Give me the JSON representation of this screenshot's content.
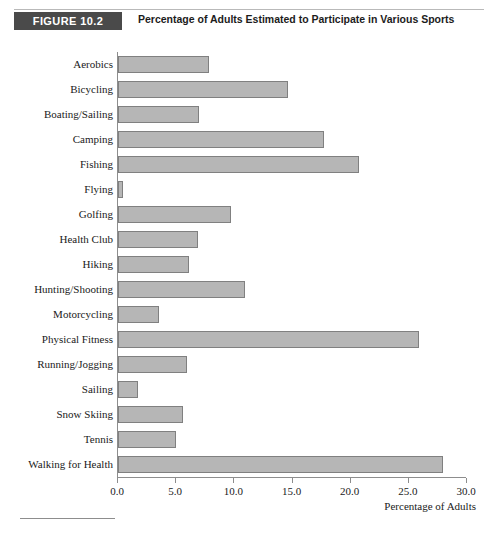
{
  "figure": {
    "badge": "FIGURE 10.2",
    "title": "Percentage of Adults Estimated to Participate in Various Sports"
  },
  "colors": {
    "badge_background": "#4a4a4a",
    "badge_text": "#ffffff",
    "bar_fill": "#b6b6b6",
    "bar_border": "#808080",
    "axis": "#8d8d8d",
    "text": "#1a1a1a"
  },
  "chart_data": {
    "type": "bar",
    "orientation": "horizontal",
    "title": "Percentage of Adults Estimated to Participate in Various Sports",
    "xlabel": "Percentage of Adults",
    "ylabel": "",
    "xlim": [
      0.0,
      30.0
    ],
    "xticks": [
      0.0,
      5.0,
      10.0,
      15.0,
      20.0,
      25.0,
      30.0
    ],
    "xtick_labels": [
      "0.0",
      "5.0",
      "10.0",
      "15.0",
      "20.0",
      "25.0",
      "30.0"
    ],
    "grid": false,
    "legend": false,
    "categories": [
      "Aerobics",
      "Bicycling",
      "Boating/Sailing",
      "Camping",
      "Fishing",
      "Flying",
      "Golfing",
      "Health Club",
      "Hiking",
      "Hunting/Shooting",
      "Motorcycling",
      "Physical Fitness",
      "Running/Jogging",
      "Sailing",
      "Snow Skiing",
      "Tennis",
      "Walking for Health"
    ],
    "values": [
      7.8,
      14.6,
      7.0,
      17.7,
      20.7,
      0.4,
      9.7,
      6.9,
      6.1,
      10.9,
      3.5,
      25.9,
      5.9,
      1.7,
      5.6,
      5.0,
      27.9
    ]
  }
}
